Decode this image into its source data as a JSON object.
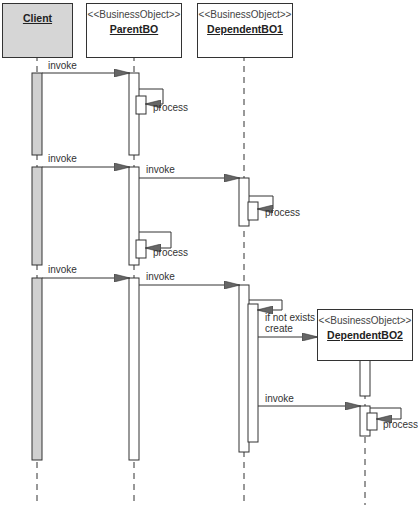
{
  "diagram": {
    "type": "UML sequence diagram",
    "colors": {
      "line": "#333333",
      "client_fill": "#d6d6d6",
      "activation_client": "#d0d0d0",
      "activation_default": "#ffffff",
      "arrowhead": "#666666"
    },
    "lifelines": [
      {
        "id": "client",
        "stereotype": "",
        "name": "Client"
      },
      {
        "id": "parent",
        "stereotype": "<<BusinessObject>>",
        "name": "ParentBO"
      },
      {
        "id": "dep1",
        "stereotype": "<<BusinessObject>>",
        "name": "DependentBO1"
      },
      {
        "id": "dep2",
        "stereotype": "<<BusinessObject>>",
        "name": "DependentBO2"
      }
    ],
    "messages": [
      {
        "from": "client",
        "to": "parent",
        "label": "invoke"
      },
      {
        "from": "parent",
        "to": "parent",
        "label": "process"
      },
      {
        "from": "client",
        "to": "parent",
        "label": "invoke"
      },
      {
        "from": "parent",
        "to": "dep1",
        "label": "invoke"
      },
      {
        "from": "dep1",
        "to": "dep1",
        "label": "process"
      },
      {
        "from": "parent",
        "to": "parent",
        "label": "process"
      },
      {
        "from": "client",
        "to": "parent",
        "label": "invoke"
      },
      {
        "from": "parent",
        "to": "dep1",
        "label": "invoke"
      },
      {
        "from": "dep1",
        "to": "dep1",
        "label": "if not exists"
      },
      {
        "from": "dep1",
        "to": "dep2",
        "label": "create"
      },
      {
        "from": "dep1",
        "to": "dep2",
        "label": "invoke"
      },
      {
        "from": "dep2",
        "to": "dep2",
        "label": "process"
      }
    ]
  }
}
